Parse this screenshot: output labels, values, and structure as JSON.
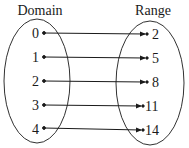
{
  "diagram": {
    "type": "mapping",
    "domain_label": "Domain",
    "range_label": "Range",
    "domain": [
      "0",
      "1",
      "2",
      "3",
      "4"
    ],
    "range": [
      "2",
      "5",
      "8",
      "11",
      "14"
    ],
    "mappings": [
      {
        "from": "0",
        "to": "2"
      },
      {
        "from": "1",
        "to": "5"
      },
      {
        "from": "2",
        "to": "8"
      },
      {
        "from": "3",
        "to": "11"
      },
      {
        "from": "4",
        "to": "14"
      }
    ],
    "colors": {
      "stroke": "#1a1a1a",
      "background": "#ffffff"
    }
  }
}
